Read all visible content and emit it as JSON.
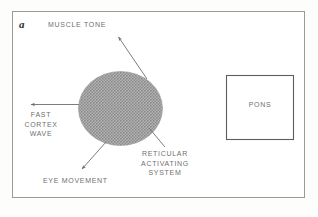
{
  "figure": {
    "panel_letter": "a",
    "background_color": "#ffffff",
    "frame_color": "#9a9a98",
    "text_color": "#6f6f6e",
    "stroke_color": "#6e6e6c",
    "ellipse_fill_color": "#a0a0a0"
  },
  "labels": {
    "muscle_tone": "MUSCLE TONE",
    "fast_cortex_wave": "FAST\nCORTEX\nWAVE",
    "eye_movement": "EYE MOVEMENT",
    "reticular_activating_system": "RETICULAR\nACTIVATING\nSYSTEM",
    "pons": "PONS"
  },
  "structures": {
    "reticular_formation_shape": "shaded-ellipse",
    "pons_shape": "rectangle"
  },
  "connectors": [
    {
      "name": "muscle-tone-arrow",
      "from": "reticular-formation",
      "to": "muscle_tone",
      "arrowhead": true
    },
    {
      "name": "fast-cortex-wave-arrow",
      "from": "reticular-formation",
      "to": "fast_cortex_wave",
      "arrowhead": true
    },
    {
      "name": "eye-movement-arrow",
      "from": "reticular-formation",
      "to": "eye_movement",
      "arrowhead": true
    },
    {
      "name": "ras-leader-line",
      "from": "reticular-formation",
      "to": "reticular_activating_system",
      "arrowhead": false
    }
  ]
}
